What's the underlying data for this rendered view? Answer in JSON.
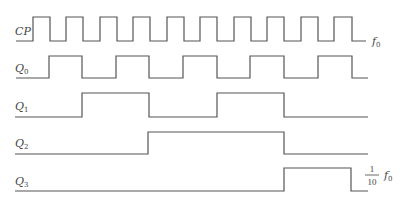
{
  "diagram": {
    "type": "timing-diagram",
    "stroke_color": "#555555",
    "signals": [
      {
        "name": "CP",
        "label_main": "CP",
        "label_sub": "",
        "freq_label": "f",
        "freq_sub": "0",
        "y_low": 41,
        "y_high": 17,
        "points": "16,41 33,41 33,17 50,17 50,41 66,41 66,17 83,17 83,41 100,41 100,17 117,17 117,41 133,41 133,17 150,17 150,41 167,41 167,17 184,17 184,41 200,41 200,17 217,17 217,41 234,41 234,17 251,17 251,41 267,41 267,17 284,17 284,41 301,41 301,17 318,17 318,41 334,41 334,17 352,17 352,41 366,41"
      },
      {
        "name": "Q0",
        "label_main": "Q",
        "label_sub": "0",
        "y_low": 78,
        "y_high": 56,
        "points": "16,78 49,78 49,56 82,56 82,78 116,78 116,56 149,56 149,78 183,78 183,56 217,56 217,78 250,78 250,56 284,56 284,78 318,78 318,56 352,56 352,78 368,78"
      },
      {
        "name": "Q1",
        "label_main": "Q",
        "label_sub": "1",
        "y_low": 117,
        "y_high": 93,
        "points": "15,117 82,117 82,93 149,93 149,117 217,117 217,93 284,93 284,117 368,117"
      },
      {
        "name": "Q2",
        "label_main": "Q",
        "label_sub": "2",
        "y_low": 154,
        "y_high": 132,
        "points": "15,154 148,154 148,132 284,132 284,154 368,154"
      },
      {
        "name": "Q3",
        "label_main": "Q",
        "label_sub": "3",
        "y_low": 191,
        "y_high": 168,
        "points": "15,191 284,191 284,168 351,168 351,191 368,191",
        "freq_numerator": "1",
        "freq_denominator": "10",
        "freq_label": "f",
        "freq_sub": "0"
      }
    ]
  }
}
